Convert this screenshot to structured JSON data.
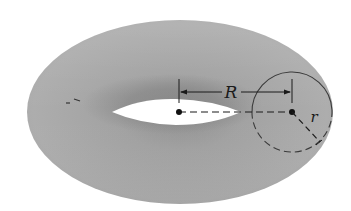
{
  "figure": {
    "labels": {
      "major_radius": "R",
      "minor_radius": "r"
    }
  },
  "colors": {
    "background": "#ffffff",
    "torus_light": "#b4b4b4",
    "torus_mid": "#a6a6a6",
    "torus_dark": "#8e8e8e",
    "hole": "#ffffff",
    "ink": "#1a1a1a"
  }
}
